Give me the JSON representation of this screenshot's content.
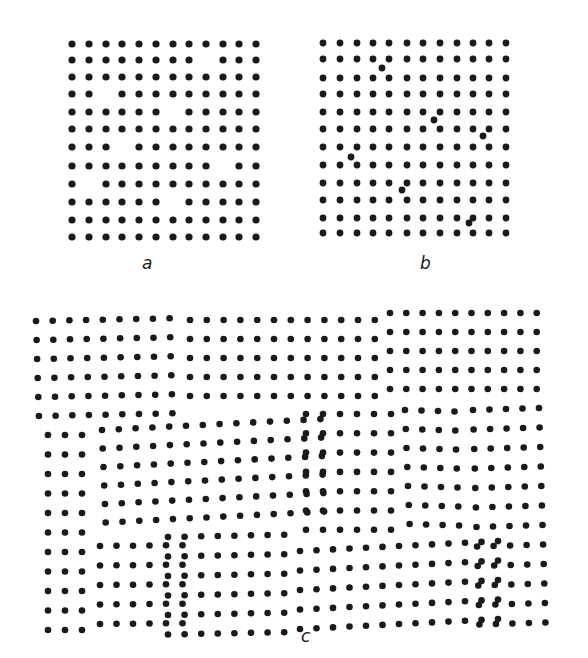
{
  "figure": {
    "dot_color": "#1a1a1a",
    "background": "#ffffff",
    "panels": [
      {
        "id": "a",
        "label": "a",
        "label_pos": [
          142,
          255
        ],
        "description": "square lattice with vacancies",
        "dot_radius": 3.6,
        "lattice": {
          "x": [
            72,
            89,
            106,
            122,
            139,
            156,
            173,
            189,
            206,
            223,
            239,
            256
          ],
          "y": [
            44,
            60,
            77,
            94,
            112,
            129,
            147,
            166,
            184,
            202,
            220,
            237
          ]
        },
        "vacancies": [
          [
            1,
            8
          ],
          [
            3,
            2
          ],
          [
            4,
            6
          ],
          [
            6,
            3
          ],
          [
            7,
            9
          ],
          [
            8,
            1
          ],
          [
            9,
            6
          ]
        ]
      },
      {
        "id": "b",
        "label": "b",
        "label_pos": [
          420,
          255
        ],
        "description": "square lattice with interstitials",
        "dot_radius": 3.4,
        "lattice": {
          "x": [
            323,
            340,
            357,
            373,
            389,
            407,
            423,
            440,
            457,
            473,
            489,
            506
          ],
          "y": [
            43,
            59,
            78,
            94,
            112,
            129,
            147,
            165,
            183,
            200,
            218,
            233
          ]
        },
        "vacancies": [],
        "interstitials": [
          [
            382,
            68
          ],
          [
            434,
            120
          ],
          [
            483,
            136
          ],
          [
            351,
            157
          ],
          [
            402,
            190
          ],
          [
            469,
            223
          ]
        ]
      },
      {
        "id": "c",
        "label": "c",
        "label_pos": [
          301,
          628
        ],
        "description": "polycrystalline lattice with grain boundaries",
        "dot_radius": 3.3,
        "grains": [
          {
            "x0": 36,
            "y0": 321,
            "dx": 16.7,
            "dy": 19.0,
            "cols": 9,
            "rows": 6,
            "skew": -0.02,
            "shear": 0.03
          },
          {
            "x0": 190,
            "y0": 320,
            "dx": 16.8,
            "dy": 19.0,
            "cols": 12,
            "rows": 5,
            "skew": 0.0,
            "shear": 0.0
          },
          {
            "x0": 390,
            "y0": 313,
            "dx": 16.3,
            "dy": 19.0,
            "cols": 10,
            "rows": 5,
            "skew": 0.0,
            "shear": 0.0
          },
          {
            "x0": 48,
            "y0": 435,
            "dx": 17.0,
            "dy": 19.5,
            "cols": 3,
            "rows": 11,
            "skew": 0.0,
            "shear": 0.0
          },
          {
            "x0": 102,
            "y0": 430,
            "dx": 16.8,
            "dy": 18.5,
            "cols": 14,
            "rows": 6,
            "skew": -0.05,
            "shear": 0.04
          },
          {
            "x0": 306,
            "y0": 414,
            "dx": 17.0,
            "dy": 19.3,
            "cols": 6,
            "rows": 7,
            "skew": 0.0,
            "shear": 0.0
          },
          {
            "x0": 405,
            "y0": 410,
            "dx": 16.5,
            "dy": 19.0,
            "cols": 4,
            "rows": 7,
            "skew": 0.03,
            "shear": 0.04
          },
          {
            "x0": 473,
            "y0": 410,
            "dx": 16.5,
            "dy": 19.5,
            "cols": 5,
            "rows": 12,
            "skew": -0.03,
            "shear": 0.03
          },
          {
            "x0": 100,
            "y0": 546,
            "dx": 16.5,
            "dy": 19.5,
            "cols": 6,
            "rows": 5,
            "skew": -0.01,
            "shear": 0.0
          },
          {
            "x0": 168,
            "y0": 537,
            "dx": 16.6,
            "dy": 19.5,
            "cols": 8,
            "rows": 6,
            "skew": -0.02,
            "shear": 0.0
          },
          {
            "x0": 300,
            "y0": 551,
            "dx": 16.5,
            "dy": 19.5,
            "cols": 13,
            "rows": 5,
            "skew": -0.05,
            "shear": 0.0
          }
        ]
      }
    ]
  }
}
